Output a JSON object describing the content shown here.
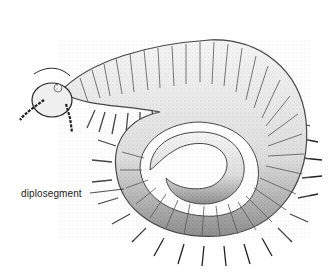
{
  "figure": {
    "labels": [
      {
        "text": "diplosegment",
        "x": 21,
        "y": 198,
        "pointer_to": [
          120,
          194
        ]
      }
    ]
  },
  "colors": {
    "ink": "#1a1a1a",
    "paper": "#ffffff",
    "shade": "#bdbdbd"
  }
}
